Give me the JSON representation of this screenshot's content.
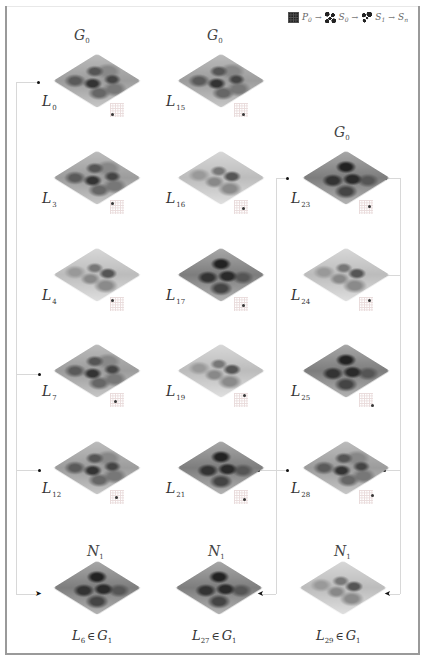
{
  "legend": {
    "items": [
      {
        "symbol": "P",
        "sub": "0",
        "icon": "solid-grid-icon"
      },
      {
        "symbol": "S",
        "sub": "0",
        "icon": "sparse-pattern-icon"
      },
      {
        "symbol": "S",
        "sub": "1",
        "icon": "sparse-pattern-icon"
      },
      {
        "symbol": "S",
        "sub": "n",
        "icon": "none"
      }
    ],
    "arrow": "→"
  },
  "columns": [
    {
      "header": {
        "symbol": "G",
        "sub": "0"
      },
      "levels": [
        {
          "name": "L",
          "sub": "0",
          "tone": "mid"
        },
        {
          "name": "L",
          "sub": "3",
          "tone": "mid"
        },
        {
          "name": "L",
          "sub": "4",
          "tone": "light"
        },
        {
          "name": "L",
          "sub": "7",
          "tone": "mid"
        },
        {
          "name": "L",
          "sub": "12",
          "tone": "mid"
        }
      ],
      "output": {
        "header": {
          "symbol": "N",
          "sub": "1"
        },
        "name": "L",
        "sub": "6",
        "rel": "∈",
        "set": "G",
        "set_sub": "1",
        "tone": "dark"
      }
    },
    {
      "header": {
        "symbol": "G",
        "sub": "0"
      },
      "levels": [
        {
          "name": "L",
          "sub": "15",
          "tone": "mid"
        },
        {
          "name": "L",
          "sub": "16",
          "tone": "light"
        },
        {
          "name": "L",
          "sub": "17",
          "tone": "dark"
        },
        {
          "name": "L",
          "sub": "19",
          "tone": "light"
        },
        {
          "name": "L",
          "sub": "21",
          "tone": "dark"
        }
      ],
      "output": {
        "header": {
          "symbol": "N",
          "sub": "1"
        },
        "name": "L",
        "sub": "27",
        "rel": "∈",
        "set": "G",
        "set_sub": "1",
        "tone": "dark"
      }
    },
    {
      "header": {
        "symbol": "G",
        "sub": "0"
      },
      "levels": [
        {
          "name": "L",
          "sub": "23",
          "tone": "dark"
        },
        {
          "name": "L",
          "sub": "24",
          "tone": "light"
        },
        {
          "name": "L",
          "sub": "25",
          "tone": "dark"
        },
        {
          "name": "L",
          "sub": "28",
          "tone": "mid"
        }
      ],
      "output": {
        "header": {
          "symbol": "N",
          "sub": "1"
        },
        "name": "L",
        "sub": "29",
        "rel": "∈",
        "set": "G",
        "set_sub": "1",
        "tone": "light"
      }
    }
  ],
  "colors": {
    "border": "#9a9a9a",
    "connector": "#d8d8d8",
    "node": "#111111"
  }
}
